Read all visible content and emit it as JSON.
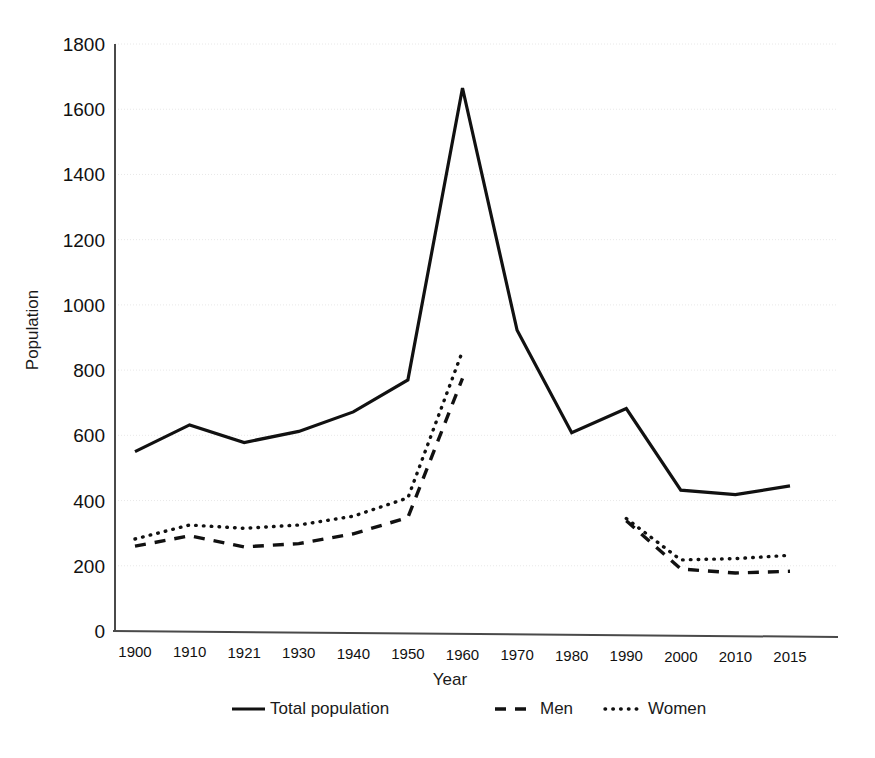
{
  "chart_data": {
    "type": "line",
    "title": "",
    "xlabel": "Year",
    "ylabel": "Population",
    "categories": [
      "1900",
      "1910",
      "1921",
      "1930",
      "1940",
      "1950",
      "1960",
      "1970",
      "1980",
      "1990",
      "2000",
      "2010",
      "2015"
    ],
    "ylim": [
      0,
      1800
    ],
    "yticks": [
      "0",
      "200",
      "400",
      "600",
      "800",
      "1000",
      "1200",
      "1400",
      "1600",
      "1800"
    ],
    "ytick_values": [
      0,
      200,
      400,
      600,
      800,
      1000,
      1200,
      1400,
      1600,
      1800
    ],
    "grid": true,
    "legend_position": "bottom",
    "series": [
      {
        "name": "Total population",
        "style": "solid",
        "values": [
          550,
          632,
          578,
          612,
          672,
          770,
          1665,
          922,
          608,
          682,
          432,
          418,
          445
        ]
      },
      {
        "name": "Men",
        "style": "dashed",
        "values": [
          260,
          292,
          258,
          268,
          298,
          348,
          775,
          null,
          null,
          338,
          190,
          178,
          183
        ]
      },
      {
        "name": "Women",
        "style": "dotted",
        "values": [
          282,
          325,
          315,
          325,
          352,
          408,
          858,
          null,
          null,
          345,
          218,
          222,
          232
        ]
      }
    ],
    "colors": {
      "line": "#111111",
      "grid": "#e8e8e8",
      "axis": "#4a4a4a",
      "background": "#ffffff"
    }
  },
  "legend": {
    "items": [
      {
        "label": "Total population",
        "style": "solid"
      },
      {
        "label": "Men",
        "style": "dashed"
      },
      {
        "label": "Women",
        "style": "dotted"
      }
    ]
  }
}
